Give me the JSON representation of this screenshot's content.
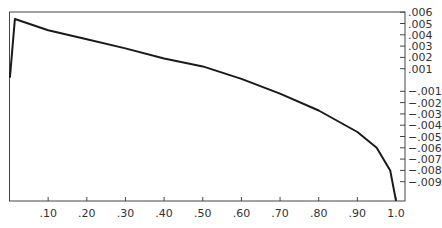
{
  "chart_data": {
    "type": "line",
    "title": "",
    "xlabel": "",
    "ylabel": "",
    "xlim": [
      0,
      1.0
    ],
    "ylim": [
      -0.0107,
      0.006
    ],
    "grid": false,
    "legend": null,
    "y_axis_position": "right",
    "x_ticks": [
      ".10",
      ".20",
      ".30",
      ".40",
      ".50",
      ".60",
      ".70",
      ".80",
      ".90",
      "1.0"
    ],
    "x_tick_values": [
      0.1,
      0.2,
      0.3,
      0.4,
      0.5,
      0.6,
      0.7,
      0.8,
      0.9,
      1.0
    ],
    "y_ticks": [
      ".006",
      ".005",
      ".004",
      ".003",
      ".002",
      ".001",
      "−.001",
      "−.002",
      "−.003",
      "−.004",
      "−.005",
      "−.006",
      "−.007",
      "−.008",
      "−.009"
    ],
    "y_tick_values": [
      0.006,
      0.005,
      0.004,
      0.003,
      0.002,
      0.001,
      -0.001,
      -0.002,
      -0.003,
      -0.004,
      -0.005,
      -0.006,
      -0.007,
      -0.008,
      -0.009
    ],
    "series": [
      {
        "name": "curve",
        "color": "#1a1a1a",
        "x": [
          0.001,
          0.014,
          0.1,
          0.2,
          0.3,
          0.4,
          0.5,
          0.6,
          0.7,
          0.8,
          0.9,
          0.95,
          0.985,
          1.0
        ],
        "y": [
          0.0002,
          0.0054,
          0.0044,
          0.0036,
          0.0028,
          0.0019,
          0.0012,
          0.0001,
          -0.0012,
          -0.0027,
          -0.0046,
          -0.006,
          -0.008,
          -0.0107
        ]
      }
    ]
  }
}
